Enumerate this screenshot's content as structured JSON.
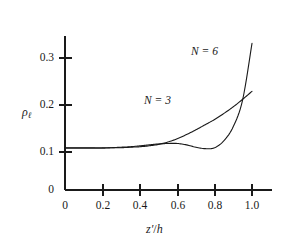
{
  "chart_data": {
    "type": "line",
    "title": "",
    "subtitle": "",
    "xlabel": "z'/h",
    "ylabel": "ρℓ",
    "xlim": [
      0,
      1.1
    ],
    "ylim": [
      0,
      0.345
    ],
    "grid": false,
    "legend_position": "inline-annotation",
    "xticks": [
      0,
      0.2,
      0.4,
      0.6,
      0.8,
      1.0
    ],
    "xtick_labels": [
      "0",
      "0.2",
      "0.4",
      "0.6",
      "0.8",
      "1.0"
    ],
    "yticks": [
      0,
      0.1,
      0.2,
      0.3
    ],
    "ytick_labels": [
      "0",
      "0.1",
      "0.2",
      "0.3"
    ],
    "series": [
      {
        "name": "N = 3",
        "label": "N = 3",
        "color": "#1a1a1a",
        "x": [
          0.0,
          0.05,
          0.1,
          0.15,
          0.2,
          0.25,
          0.3,
          0.35,
          0.4,
          0.45,
          0.5,
          0.55,
          0.6,
          0.65,
          0.7,
          0.75,
          0.8,
          0.85,
          0.9,
          0.95,
          1.0
        ],
        "y": [
          0.09,
          0.09,
          0.09,
          0.09,
          0.09,
          0.09,
          0.09,
          0.091,
          0.092,
          0.094,
          0.097,
          0.102,
          0.109,
          0.118,
          0.128,
          0.139,
          0.15,
          0.163,
          0.177,
          0.193,
          0.21
        ]
      },
      {
        "name": "N = 6",
        "label": "N = 6",
        "color": "#1a1a1a",
        "x": [
          0.0,
          0.05,
          0.1,
          0.15,
          0.2,
          0.25,
          0.3,
          0.35,
          0.4,
          0.45,
          0.5,
          0.55,
          0.6,
          0.65,
          0.7,
          0.75,
          0.8,
          0.85,
          0.9,
          0.95,
          1.0
        ],
        "y": [
          0.089,
          0.089,
          0.089,
          0.089,
          0.089,
          0.09,
          0.091,
          0.092,
          0.094,
          0.096,
          0.098,
          0.099,
          0.099,
          0.096,
          0.091,
          0.088,
          0.09,
          0.105,
          0.135,
          0.192,
          0.312
        ]
      }
    ],
    "annotations": [
      {
        "text": "N = 6",
        "x": 0.8,
        "y": 0.295
      },
      {
        "text": "N = 3",
        "x": 0.58,
        "y": 0.195
      }
    ],
    "axis_color": "#1a1a1a",
    "background_color": "#ffffff"
  },
  "axes_geometry": {
    "x_origin_px": 65,
    "y_baseline_px": 190,
    "x_end_px": 272,
    "y_top_px": 36,
    "x_per_unit_px": 187,
    "y_per_unit_px": 470
  },
  "tick_labels": {
    "y": [
      "0.3",
      "0.2",
      "0.1",
      "0"
    ],
    "x": [
      "0",
      "0.2",
      "0.4",
      "0.6",
      "0.8",
      "1.0"
    ]
  },
  "labels": {
    "y_axis_symbol": "ρ",
    "y_axis_subscript": "ℓ",
    "x_axis_numerator": "z′",
    "x_axis_slash": "/",
    "x_axis_denominator": "h",
    "series_6": "N = 6",
    "series_3": "N = 3"
  }
}
